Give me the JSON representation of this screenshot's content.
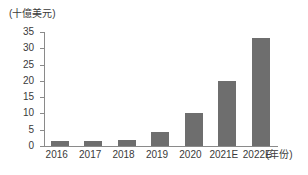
{
  "chart_data": {
    "type": "bar",
    "title": "",
    "subtitle": "",
    "xlabel": "(年份)",
    "ylabel": "(十億美元)",
    "categories": [
      "2016",
      "2017",
      "2018",
      "2019",
      "2020",
      "2021E",
      "2022E"
    ],
    "values": [
      1.5,
      1.4,
      2.0,
      4.3,
      10.0,
      20.0,
      33.3
    ],
    "series": [
      {
        "name": "",
        "values": [
          1.5,
          1.4,
          2.0,
          4.3,
          10.0,
          20.0,
          33.3
        ]
      }
    ],
    "ylim": [
      0,
      35
    ],
    "ytick_labels": [
      "0",
      "5",
      "10",
      "15",
      "20",
      "25",
      "30",
      "35"
    ],
    "ytick_values": [
      0,
      5,
      10,
      15,
      20,
      25,
      30,
      35
    ],
    "grid": false,
    "legend": null,
    "legend_position": "none",
    "bar_color": "#6e6e6e",
    "axis_color": "#8a8a8a",
    "text_color": "#3a3a3a",
    "background": "#ffffff"
  }
}
